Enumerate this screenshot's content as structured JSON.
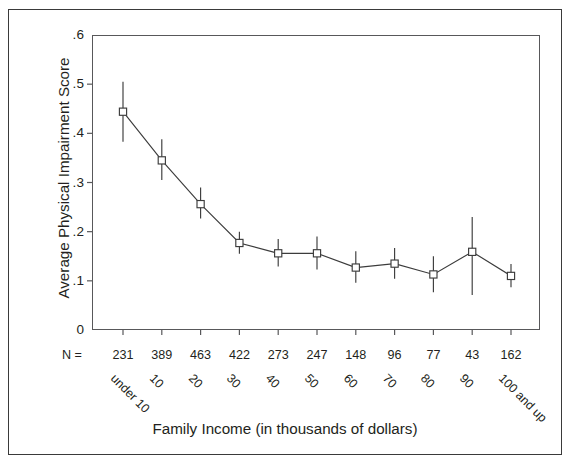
{
  "chart_data": {
    "type": "line",
    "title": "",
    "xlabel": "Family Income (in thousands of dollars)",
    "ylabel": "Average Physical Impairment Score",
    "ylim": [
      0,
      0.6
    ],
    "y_ticks": [
      0,
      0.1,
      0.2,
      0.3,
      0.4,
      0.5,
      0.6
    ],
    "y_tick_labels": [
      "0",
      ".1",
      ".2",
      ".3",
      ".4",
      ".5",
      ".6"
    ],
    "grid": false,
    "legend": null,
    "marker": "open-square",
    "error_bars": "95% confidence interval",
    "n_row_label": "N =",
    "categories": [
      "under 10",
      "10",
      "20",
      "30",
      "40",
      "50",
      "60",
      "70",
      "80",
      "90",
      "100 and up"
    ],
    "n_values": [
      231,
      389,
      463,
      422,
      273,
      247,
      148,
      96,
      77,
      43,
      162
    ],
    "values": [
      0.444,
      0.345,
      0.256,
      0.177,
      0.156,
      0.156,
      0.127,
      0.135,
      0.113,
      0.159,
      0.11
    ],
    "error_low": [
      0.383,
      0.305,
      0.227,
      0.155,
      0.129,
      0.123,
      0.096,
      0.104,
      0.077,
      0.071,
      0.087
    ],
    "error_high": [
      0.505,
      0.388,
      0.29,
      0.2,
      0.185,
      0.19,
      0.16,
      0.167,
      0.15,
      0.23,
      0.134
    ]
  },
  "style": {
    "line_color": "#3c3c3c",
    "marker_color": "#3c3c3c",
    "frame_color": "#58585a",
    "text_color": "#231f20",
    "background": "#ffffff"
  }
}
